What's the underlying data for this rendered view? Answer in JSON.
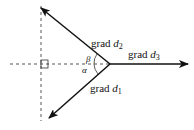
{
  "diagram": {
    "labels": {
      "grad_d2": {
        "prefix": "grad ",
        "var": "d",
        "sub": "2"
      },
      "grad_d3": {
        "prefix": "grad ",
        "var": "d",
        "sub": "3"
      },
      "grad_d1": {
        "prefix": "grad ",
        "var": "d",
        "sub": "1"
      },
      "beta": "β",
      "alpha": "α"
    },
    "colors": {
      "line": "#111111",
      "dashed": "#555555"
    }
  }
}
